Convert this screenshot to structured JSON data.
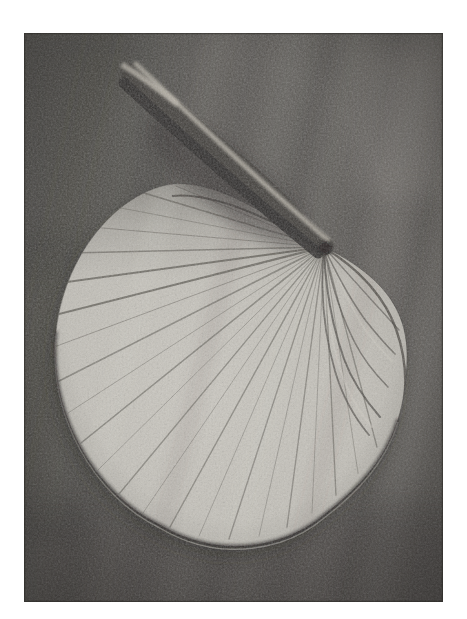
{
  "page": {
    "background_color": "#ffffff"
  },
  "photo": {
    "alt": "Grainy black-and-white photograph of a rounded fan-shaped palm leaf. Fine veins radiate from a dark attachment point at the upper right of the blade, where a stout curved stalk enters diagonally from the upper left. The pleated right side of the blade folds downward. The specimen lies on a dark, diagonally streaked background, and the print has a white margin on all sides.",
    "colors": {
      "margin": "#ffffff",
      "background": "#54514d",
      "background_streak_light": "#8e8a84",
      "background_streak_dark": "#3a3734",
      "leaf_blade": "#c6c3bb",
      "leaf_veins": "#4d4a43",
      "petiole": "#3a3733",
      "petiole_highlight": "#ada89d",
      "attachment_knob": "#1b1917",
      "shadow": "#1d1b19"
    }
  }
}
